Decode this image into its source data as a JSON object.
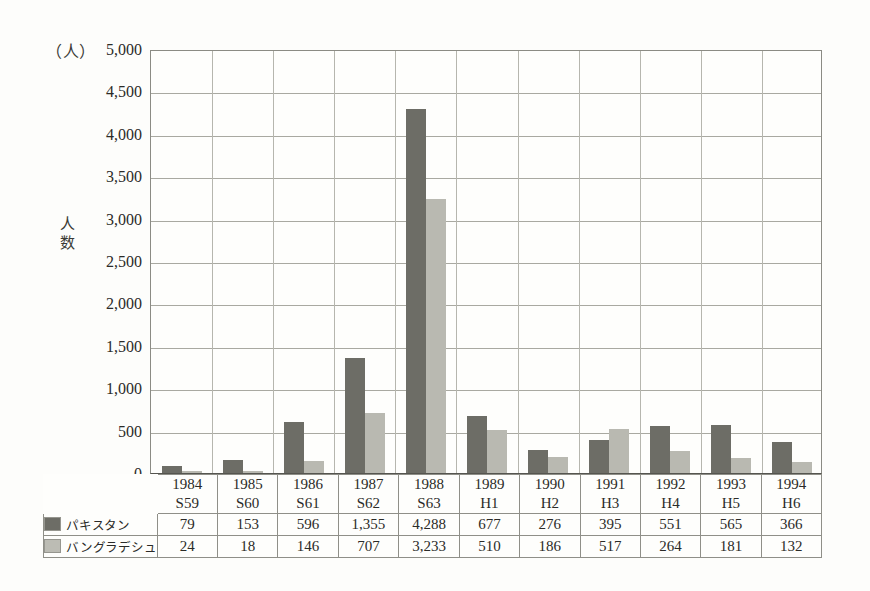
{
  "chart_data": {
    "type": "bar",
    "title": "",
    "xlabel": "",
    "ylabel": "人数",
    "unit_label": "（人）",
    "ylim": [
      0,
      5000
    ],
    "ytick_step": 500,
    "grid": true,
    "legend_position": "table-left",
    "categories": [
      "1984",
      "1985",
      "1986",
      "1987",
      "1988",
      "1989",
      "1990",
      "1991",
      "1992",
      "1993",
      "1994"
    ],
    "category_sublabels": [
      "S59",
      "S60",
      "S61",
      "S62",
      "S63",
      "H1",
      "H2",
      "H3",
      "H4",
      "H5",
      "H6"
    ],
    "ytick_labels": [
      "5,000",
      "4,500",
      "4,000",
      "3,500",
      "3,000",
      "2,500",
      "2,000",
      "1,500",
      "1,000",
      "500",
      "0"
    ],
    "ytick_values": [
      5000,
      4500,
      4000,
      3500,
      3000,
      2500,
      2000,
      1500,
      1000,
      500,
      0
    ],
    "series": [
      {
        "name": "パキスタン",
        "color": "#6d6d66",
        "values": [
          79,
          153,
          596,
          1355,
          4288,
          677,
          276,
          395,
          551,
          565,
          366
        ],
        "value_labels": [
          "79",
          "153",
          "596",
          "1,355",
          "4,288",
          "677",
          "276",
          "395",
          "551",
          "565",
          "366"
        ]
      },
      {
        "name": "バングラデシュ",
        "color": "#b9b9b1",
        "values": [
          24,
          18,
          146,
          707,
          3233,
          510,
          186,
          517,
          264,
          181,
          132
        ],
        "value_labels": [
          "24",
          "18",
          "146",
          "707",
          "3,233",
          "510",
          "186",
          "517",
          "264",
          "181",
          "132"
        ]
      }
    ]
  },
  "colors": {
    "series_dark": "#6d6d66",
    "series_light": "#b9b9b1",
    "axis": "#55554f",
    "grid": "#a9a9a1",
    "border": "#8f8f88",
    "background": "#fdfdfb"
  }
}
